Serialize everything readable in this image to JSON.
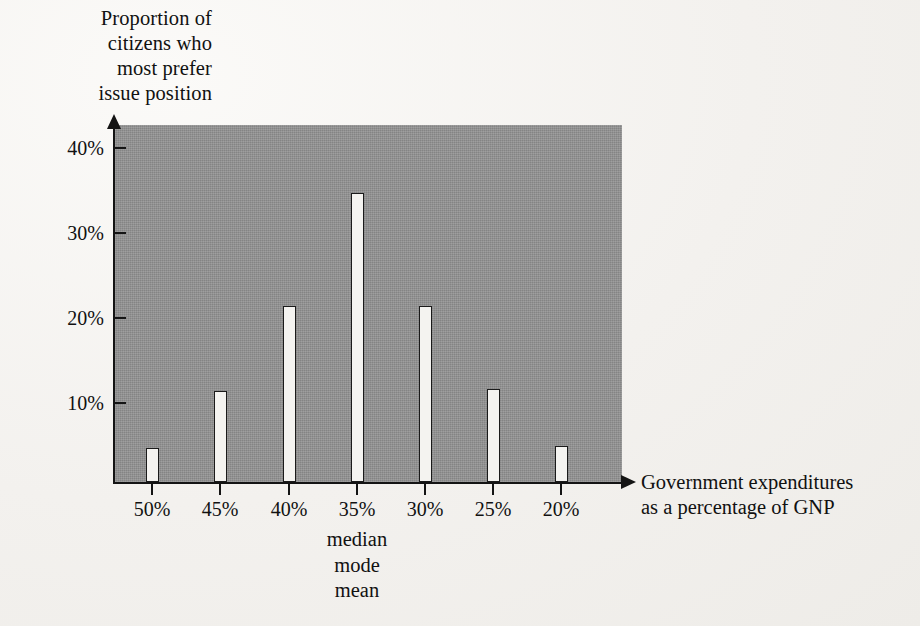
{
  "chart_data": {
    "type": "bar",
    "title": "",
    "ylabel": "Proportion of citizens who most prefer issue position",
    "ylabel_lines": [
      "Proportion of",
      "citizens who",
      "most prefer",
      "issue position"
    ],
    "xlabel": "Government expenditures as a percentage of GNP",
    "xlabel_lines": [
      "Government expenditures",
      "as a percentage of GNP"
    ],
    "categories": [
      "50%",
      "45%",
      "40%",
      "35%",
      "30%",
      "25%",
      "20%"
    ],
    "values": [
      3.3,
      10.0,
      20.0,
      33.3,
      20.0,
      10.3,
      3.5
    ],
    "ytick_labels": [
      "40%",
      "30%",
      "20%",
      "10%"
    ],
    "ytick_values": [
      40,
      30,
      20,
      10
    ],
    "ylim": [
      0,
      42
    ],
    "grid": false,
    "legend": null,
    "annotations": [
      {
        "text_lines": [
          "median",
          "mode",
          "mean"
        ],
        "at_category": "35%"
      }
    ],
    "colors": {
      "plot_background": "#949494",
      "bar_fill": "#f4f3f0",
      "bar_outline": "#1a1a1a",
      "axis": "#141414",
      "page_background": "#f3f1ee",
      "text": "#111111"
    }
  }
}
